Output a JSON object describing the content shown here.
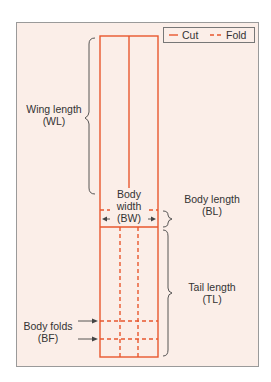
{
  "diagram": {
    "legend": {
      "cut_label": "Cut",
      "fold_label": "Fold"
    },
    "labels": {
      "wing_length": [
        "Wing length",
        "(WL)"
      ],
      "body_width": [
        "Body",
        "width",
        "(BW)"
      ],
      "body_length": [
        "Body length",
        "(BL)"
      ],
      "tail_length": [
        "Tail length",
        "(TL)"
      ],
      "body_folds": [
        "Body folds",
        "(BF)"
      ]
    },
    "colors": {
      "line": "#e8572e",
      "panel_bg": "#fbeee8",
      "border": "#9a9a9a",
      "text": "#333333"
    }
  }
}
